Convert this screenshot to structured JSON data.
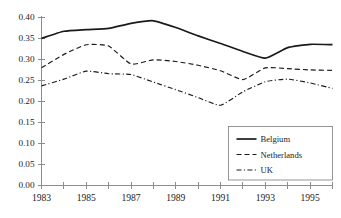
{
  "chart_data": {
    "type": "line",
    "title": "",
    "xlabel": "",
    "ylabel": "",
    "x": [
      1983,
      1984,
      1985,
      1986,
      1987,
      1988,
      1989,
      1990,
      1991,
      1992,
      1993,
      1994,
      1995,
      1996
    ],
    "xlim": [
      1983,
      1996
    ],
    "ylim": [
      0.0,
      0.4
    ],
    "ytick_labels": [
      "0.40",
      "0.35",
      "0.30",
      "0.25",
      "0.20",
      "0.15",
      "0.10",
      "0.05",
      "0.00"
    ],
    "ytick_values": [
      0.4,
      0.35,
      0.3,
      0.25,
      0.2,
      0.15,
      0.1,
      0.05,
      0.0
    ],
    "xtick_values": [
      1983,
      1984,
      1985,
      1986,
      1987,
      1988,
      1989,
      1990,
      1991,
      1992,
      1993,
      1994,
      1995,
      1996
    ],
    "xtick_labels": [
      "1983",
      "",
      "1985",
      "",
      "1987",
      "",
      "1989",
      "",
      "1991",
      "",
      "1993",
      "",
      "1995",
      ""
    ],
    "grid": false,
    "legend_position": "bottom-right",
    "series": [
      {
        "name": "Belgium",
        "style": "solid",
        "color": "#1a1a1a",
        "values": [
          0.349,
          0.366,
          0.37,
          0.373,
          0.385,
          0.391,
          0.375,
          0.355,
          0.337,
          0.318,
          0.302,
          0.327,
          0.335,
          0.334
        ]
      },
      {
        "name": "Netherlands",
        "style": "dashed",
        "color": "#1a1a1a",
        "values": [
          0.279,
          0.311,
          0.334,
          0.331,
          0.288,
          0.298,
          0.294,
          0.285,
          0.272,
          0.251,
          0.279,
          0.277,
          0.274,
          0.273
        ]
      },
      {
        "name": "UK",
        "style": "dash-dot",
        "color": "#1a1a1a",
        "values": [
          0.236,
          0.252,
          0.271,
          0.265,
          0.263,
          0.245,
          0.227,
          0.208,
          0.19,
          0.222,
          0.246,
          0.252,
          0.243,
          0.23
        ]
      }
    ]
  },
  "legend": {
    "entries": [
      {
        "label": "Belgium"
      },
      {
        "label": "Netherlands"
      },
      {
        "label": "UK"
      }
    ]
  }
}
